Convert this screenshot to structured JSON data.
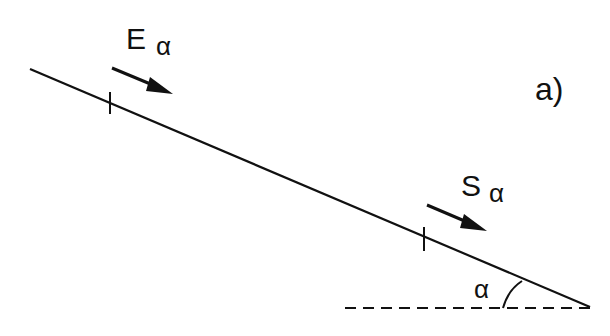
{
  "diagram": {
    "panel_label": "a)",
    "upper_force": {
      "symbol": "E",
      "subscript": "α"
    },
    "lower_force": {
      "symbol": "S",
      "subscript": "α"
    },
    "angle_label": "α"
  }
}
